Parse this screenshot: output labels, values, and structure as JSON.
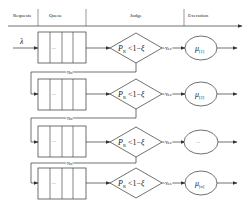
{
  "diagram": {
    "header": {
      "columns": [
        {
          "label": "Requests"
        },
        {
          "label": "Queue"
        },
        {
          "label": "Judge"
        },
        {
          "label": "Execution"
        }
      ]
    },
    "input_label": "λ",
    "queue_ellipsis": "···",
    "condition": {
      "lhs": "P",
      "lhs_sub": "R",
      "op": " <1−",
      "rhs": "ξ"
    },
    "yes_label": "Yes",
    "no_label": "No",
    "rows": [
      {
        "server_label": "μ",
        "server_sub": "[1]"
      },
      {
        "server_label": "μ",
        "server_sub": "[2]"
      },
      {
        "server_label": "···",
        "server_sub": ""
      },
      {
        "server_label": "μ",
        "server_sub": "[n]"
      }
    ],
    "colors": {
      "stroke": "#333333",
      "text": "#222222",
      "background": "#ffffff"
    }
  }
}
